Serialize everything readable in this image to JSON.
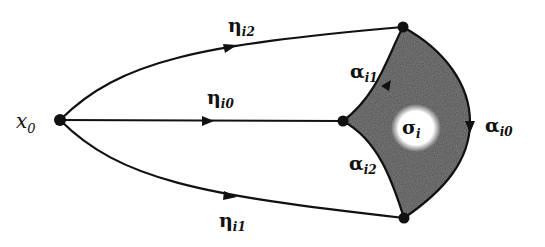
{
  "diagram": {
    "colors": {
      "stroke": "#111111",
      "shade": "#4a4a4a",
      "background": "#ffffff"
    },
    "nodes": [
      {
        "id": "x0",
        "label": "x",
        "subscript": "0"
      },
      {
        "id": "top",
        "label": ""
      },
      {
        "id": "mid",
        "label": ""
      },
      {
        "id": "bottom",
        "label": ""
      }
    ],
    "paths": [
      {
        "id": "eta_i2",
        "symbol": "η",
        "subscript": "i2",
        "from": "x0",
        "to": "top"
      },
      {
        "id": "eta_i0",
        "symbol": "η",
        "subscript": "i0",
        "from": "x0",
        "to": "mid"
      },
      {
        "id": "eta_i1",
        "symbol": "η",
        "subscript": "i1",
        "from": "x0",
        "to": "bottom"
      },
      {
        "id": "alpha_i1",
        "symbol": "α",
        "subscript": "i1",
        "from": "mid",
        "to": "top"
      },
      {
        "id": "alpha_i2",
        "symbol": "α",
        "subscript": "i2",
        "from": "bottom",
        "to": "mid"
      },
      {
        "id": "alpha_i0",
        "symbol": "α",
        "subscript": "i0",
        "from": "top",
        "to": "bottom"
      }
    ],
    "region": {
      "id": "sigma_i",
      "symbol": "σ",
      "subscript": "i"
    }
  }
}
